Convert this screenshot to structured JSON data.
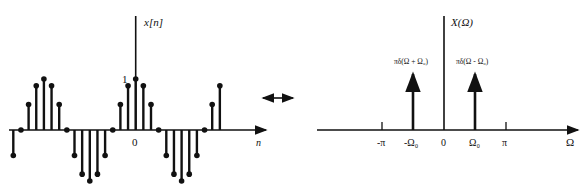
{
  "left_plot": {
    "y_label": "x[n]",
    "x_label": "n",
    "origin_label": "0",
    "peak_label": "1",
    "period": 12,
    "samples": [
      {
        "n": -12,
        "v": 1.0
      },
      {
        "n": -11,
        "v": 0.866
      },
      {
        "n": -13,
        "v": 0.866
      },
      {
        "n": -10,
        "v": 0.5
      },
      {
        "n": -14,
        "v": 0.5
      },
      {
        "n": -9,
        "v": 0
      },
      {
        "n": -15,
        "v": 0
      },
      {
        "n": -8,
        "v": -0.5
      },
      {
        "n": -7,
        "v": -0.866
      },
      {
        "n": -6,
        "v": -1.0
      },
      {
        "n": -5,
        "v": -0.866
      },
      {
        "n": -4,
        "v": -0.5
      },
      {
        "n": -3,
        "v": 0
      },
      {
        "n": -2,
        "v": 0.5
      },
      {
        "n": -1,
        "v": 0.866
      },
      {
        "n": 0,
        "v": 1.0
      },
      {
        "n": 1,
        "v": 0.866
      },
      {
        "n": 2,
        "v": 0.5
      },
      {
        "n": 3,
        "v": 0
      }
    ],
    "color": "#111111"
  },
  "arrow": {
    "type": "double-arrow",
    "meaning": "transform pair"
  },
  "right_plot": {
    "y_label": "X(Ω)",
    "x_label": "Ω",
    "ticks": [
      {
        "label": "-π",
        "pos": -2
      },
      {
        "label": "-Ω₀",
        "pos": -1
      },
      {
        "label": "0",
        "pos": 0
      },
      {
        "label": "Ω₀",
        "pos": 1
      },
      {
        "label": "π",
        "pos": 2
      }
    ],
    "impulses": [
      {
        "pos": -1,
        "label": "πδ(Ω + Ω₀)"
      },
      {
        "pos": 1,
        "label": "πδ(Ω - Ω₀)"
      }
    ]
  }
}
